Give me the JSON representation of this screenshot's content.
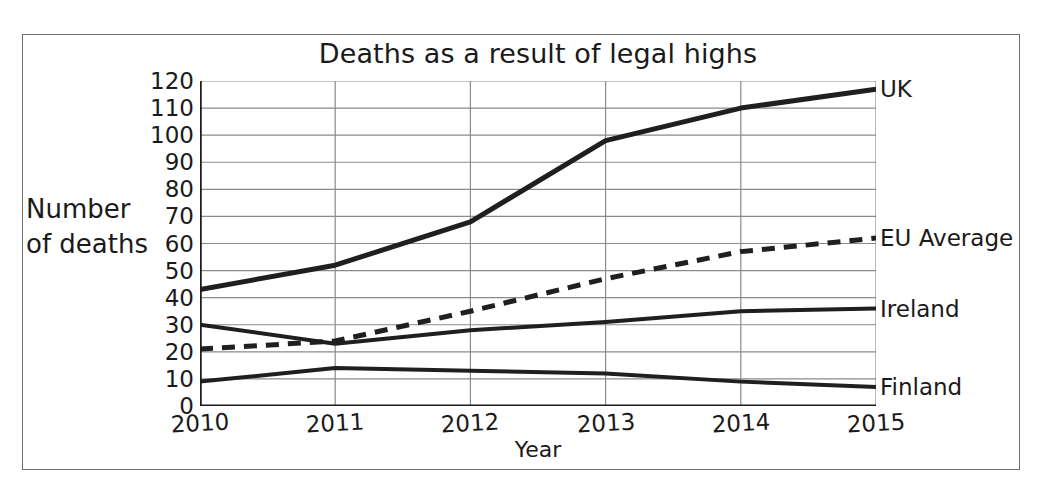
{
  "chart_data": {
    "type": "line",
    "title": "Deaths as a result of legal highs",
    "xlabel": "Year",
    "ylabel_line1": "Number",
    "ylabel_line2": "of deaths",
    "x": [
      2010,
      2011,
      2012,
      2013,
      2014,
      2015
    ],
    "xtick_labels": [
      "2010",
      "2011",
      "2012",
      "2013",
      "2014",
      "2015"
    ],
    "ytick_labels": [
      "0",
      "10",
      "20",
      "30",
      "40",
      "50",
      "60",
      "70",
      "80",
      "90",
      "100",
      "110",
      "120"
    ],
    "yticks": [
      0,
      10,
      20,
      30,
      40,
      50,
      60,
      70,
      80,
      90,
      100,
      110,
      120
    ],
    "xlim": [
      2010,
      2015
    ],
    "ylim": [
      0,
      120
    ],
    "grid": "horizontal-and-vertical",
    "legend_position": "right-of-line-ends",
    "series": [
      {
        "name": "UK",
        "label": "UK",
        "style": "solid",
        "color": "#1f1f1f",
        "width": 5,
        "values": [
          43,
          52,
          68,
          98,
          110,
          117
        ]
      },
      {
        "name": "EU Average",
        "label": "EU Average",
        "style": "dashed",
        "color": "#1f1f1f",
        "width": 5,
        "values": [
          21,
          24,
          35,
          47,
          57,
          62
        ]
      },
      {
        "name": "Ireland",
        "label": "Ireland",
        "style": "solid",
        "color": "#1f1f1f",
        "width": 4,
        "values": [
          30,
          23,
          28,
          31,
          35,
          36
        ]
      },
      {
        "name": "Finland",
        "label": "Finland",
        "style": "solid",
        "color": "#1f1f1f",
        "width": 4,
        "values": [
          9,
          14,
          13,
          12,
          9,
          7
        ]
      }
    ],
    "axis_color": "#1c1c1c",
    "grid_color": "#8a8a8a",
    "background": "#ffffff"
  }
}
